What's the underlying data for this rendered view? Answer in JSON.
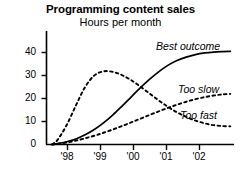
{
  "chart_data": {
    "type": "line",
    "title": "Programming content sales",
    "subtitle": "Hours per month",
    "xlabel": "",
    "ylabel": "",
    "ylim": [
      0,
      46
    ],
    "xlim": [
      1997.7,
      2002.8
    ],
    "grid": false,
    "legend_position": "inline-right",
    "yticks": [
      "0",
      "10",
      "20",
      "30",
      "40"
    ],
    "ytick_values": [
      0,
      10,
      20,
      30,
      40
    ],
    "xticks": [
      "'98",
      "'99",
      "'00",
      "'01",
      "'02"
    ],
    "xtick_values": [
      1998,
      1999,
      2000,
      2001,
      2002
    ],
    "x": [
      1997.85,
      1998,
      1998.25,
      1998.5,
      1998.75,
      1999,
      1999.25,
      1999.5,
      1999.75,
      2000,
      2000.25,
      2000.5,
      2000.75,
      2001,
      2001.25,
      2001.5,
      2001.75,
      2002,
      2002.25,
      2002.5,
      2002.7
    ],
    "series": [
      {
        "name": "Best outcome",
        "style": "solid",
        "color": "#000000",
        "values": [
          0,
          0.4,
          1.2,
          2.4,
          4.2,
          6.5,
          9.4,
          12.8,
          16.6,
          20.6,
          24.6,
          28.3,
          31.6,
          34.4,
          36.5,
          38.0,
          39.1,
          39.8,
          40.2,
          40.4,
          40.5
        ]
      },
      {
        "name": "Too fast",
        "style": "dashed",
        "color": "#000000",
        "values": [
          0,
          2.0,
          8.5,
          17.0,
          25.0,
          30.0,
          31.8,
          31.6,
          30.2,
          28.0,
          25.2,
          22.2,
          19.2,
          16.4,
          14.0,
          12.0,
          10.4,
          9.2,
          8.4,
          8.0,
          7.9
        ]
      },
      {
        "name": "Too slow",
        "style": "dashed",
        "color": "#000000",
        "values": [
          0,
          0.3,
          0.9,
          1.7,
          2.7,
          3.8,
          5.1,
          6.5,
          8.0,
          9.6,
          11.2,
          12.8,
          14.4,
          15.9,
          17.3,
          18.6,
          19.7,
          20.6,
          21.3,
          21.8,
          22.0
        ]
      }
    ],
    "annotations": [
      {
        "text": "Best outcome",
        "series": "Best outcome"
      },
      {
        "text": "Too slow",
        "series": "Too slow"
      },
      {
        "text": "Too fast",
        "series": "Too fast"
      }
    ]
  }
}
